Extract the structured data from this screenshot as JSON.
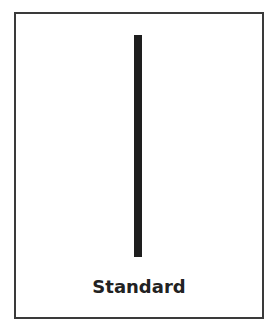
{
  "card": {
    "label": "Standard",
    "border_color": "#3a3a3a",
    "bar_color": "#1e1e1e",
    "text_color": "#222222"
  }
}
